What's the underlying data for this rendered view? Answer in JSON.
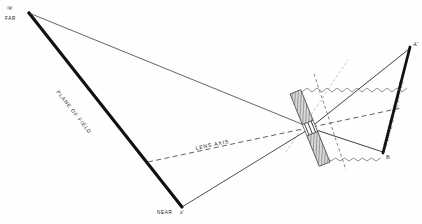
{
  "diagram": {
    "background_color": "#fefefe",
    "ink_color": "#1a1a1a",
    "labels": {
      "infinity": "∞",
      "far": "FAR",
      "near": "NEAR",
      "near_point": "a'",
      "plane_of_field": "PLANE OF FIELD",
      "lens_axis": "LENS AXIS",
      "plane_of_negative": "PLANE OF NEGATIVE",
      "point_a_prime": "A'",
      "point_b": "B"
    },
    "elements": {
      "lens_board": "tilted-hatched-lens-board",
      "aperture": "lens-aperture-gap",
      "zigzag_upper": "upper-zigzag-ray",
      "zigzag_lower": "lower-zigzag-ray",
      "ray_dashed": "dashed-construction-ray"
    },
    "geometry": {
      "far_vertex": [
        28,
        12
      ],
      "near_vertex": [
        182,
        207
      ],
      "lens_center": [
        310,
        128
      ],
      "negative_top": [
        410,
        48
      ],
      "negative_bottom": [
        383,
        152
      ]
    }
  }
}
